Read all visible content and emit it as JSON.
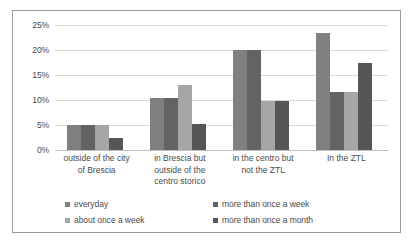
{
  "chart_data": {
    "type": "bar",
    "title": "",
    "subtitle": "",
    "xlabel": "",
    "ylabel": "",
    "ylim": [
      0,
      25
    ],
    "grid": true,
    "legend_position": "bottom",
    "y_ticks": [
      "0%",
      "5%",
      "10%",
      "15%",
      "20%",
      "25%"
    ],
    "y_tick_values": [
      0,
      5,
      10,
      15,
      20,
      25
    ],
    "categories": [
      "outside of the city\nof Brescia",
      "in Brescia but\noutside of the\ncentro storico",
      "in the centro but\nnot the ZTL",
      "In the ZTL"
    ],
    "series": [
      {
        "name": "everyday",
        "color": "#808080",
        "values": [
          5.0,
          10.4,
          20.0,
          23.4
        ]
      },
      {
        "name": "more than once a week",
        "color": "#636363",
        "values": [
          5.0,
          10.4,
          20.0,
          11.7
        ]
      },
      {
        "name": "about once a week",
        "color": "#a6a6a6",
        "values": [
          5.0,
          13.0,
          9.9,
          11.7
        ]
      },
      {
        "name": "more than once a month",
        "color": "#565656",
        "values": [
          2.5,
          5.2,
          9.9,
          17.5
        ]
      }
    ]
  },
  "legend": {
    "items": [
      {
        "label": "everyday",
        "color": "#808080"
      },
      {
        "label": "more than once a week",
        "color": "#636363"
      },
      {
        "label": "about once a week",
        "color": "#a6a6a6"
      },
      {
        "label": "more than once a month",
        "color": "#565656"
      }
    ]
  },
  "colors": {
    "border": "#9a9a9a",
    "gridline": "#d9d9d9",
    "axis": "#bfbfbf",
    "text": "#4a4a4a",
    "background": "#ffffff"
  }
}
